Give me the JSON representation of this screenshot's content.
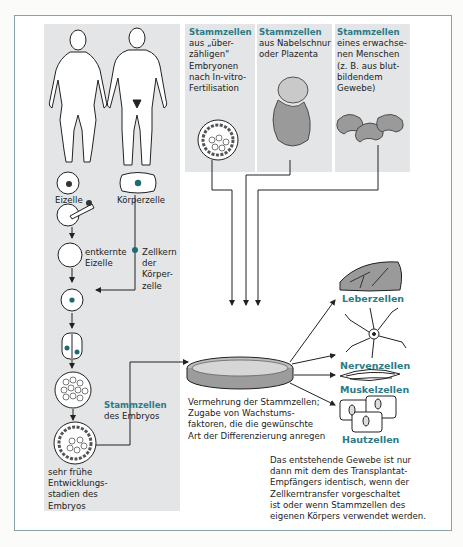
{
  "left_panel": {
    "cells": {
      "eizelle": "Eizelle",
      "koerperzelle": "Körperzelle",
      "entkernte_eizelle": [
        "entkernte",
        "Eizelle"
      ],
      "zellkern": [
        "Zellkern",
        "der",
        "Körper-",
        "zelle"
      ],
      "embryo_stem_title": "Stammzellen",
      "embryo_stem_sub": "des Embryos",
      "early_stages": [
        "sehr frühe",
        "Entwicklungs-",
        "stadien des",
        "Embryos"
      ]
    }
  },
  "sources": [
    {
      "title": "Stammzellen",
      "lines": [
        "aus „über-",
        "zähligen\"",
        "Embryonen",
        "nach In-vitro-",
        "Fertilisation"
      ]
    },
    {
      "title": "Stammzellen",
      "lines": [
        "aus Nabelschnur",
        "oder Plazenta"
      ]
    },
    {
      "title": "Stammzellen",
      "lines": [
        "eines erwachse-",
        "nen Menschen",
        "(z. B. aus blut-",
        "bildendem",
        "Gewebe)"
      ]
    }
  ],
  "dish_caption": [
    "Vermehrung der Stammzellen;",
    "Zugabe von Wachstums-",
    "faktoren, die die gewünschte",
    "Art der Differenzierung anregen"
  ],
  "outputs": [
    "Leberzellen",
    "Nervenzellen",
    "Muskelzellen",
    "Hautzellen"
  ],
  "note": [
    "Das entstehende Gewebe ist nur",
    "dann mit dem des Transplantat-",
    "Empfängers identisch, wenn der",
    "Zellkerntransfer vorgeschaltet",
    "ist oder wenn Stammzellen des",
    "eigenen Körpers verwendet werden."
  ],
  "colors": {
    "accent": "#2d7b86",
    "panel": "#e4e5e6",
    "nucleus": "#1f6b74"
  }
}
